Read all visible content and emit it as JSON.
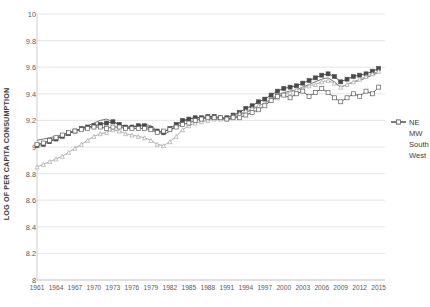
{
  "chart_data": {
    "type": "line",
    "title": "",
    "subtitle": "",
    "xlabel": "",
    "ylabel": "LOG OF PER CAPITA CONSUMPTION",
    "xlim": [
      1961,
      2016
    ],
    "ylim": [
      8,
      10
    ],
    "ytick_step": 0.2,
    "xtick_step": 3,
    "grid": "horizontal",
    "legend_position": "right",
    "ytick_labels": [
      "8",
      "8.2",
      "8.4",
      "8.6",
      "8.8",
      "9",
      "9.2",
      "9.4",
      "9.6",
      "9.8",
      "10"
    ],
    "ytick_values": [
      8,
      8.2,
      8.4,
      8.6,
      8.8,
      9,
      9.2,
      9.4,
      9.6,
      9.8,
      10
    ],
    "xtick_labels": [
      "1961",
      "1964",
      "1967",
      "1970",
      "1973",
      "1976",
      "1979",
      "1982",
      "1985",
      "1988",
      "1991",
      "1994",
      "1997",
      "2000",
      "2003",
      "2006",
      "2009",
      "2012",
      "2015"
    ],
    "xtick_values": [
      1961,
      1964,
      1967,
      1970,
      1973,
      1976,
      1979,
      1982,
      1985,
      1988,
      1991,
      1994,
      1997,
      2000,
      2003,
      2006,
      2009,
      2012,
      2015
    ],
    "x": [
      1961,
      1962,
      1963,
      1964,
      1965,
      1966,
      1967,
      1968,
      1969,
      1970,
      1971,
      1972,
      1973,
      1974,
      1975,
      1976,
      1977,
      1978,
      1979,
      1980,
      1981,
      1982,
      1983,
      1984,
      1985,
      1986,
      1987,
      1988,
      1989,
      1990,
      1991,
      1992,
      1993,
      1994,
      1995,
      1996,
      1997,
      1998,
      1999,
      2000,
      2001,
      2002,
      2003,
      2004,
      2005,
      2006,
      2007,
      2008,
      2009,
      2010,
      2011,
      2012,
      2013,
      2014,
      2015
    ],
    "series": [
      {
        "name": "NE",
        "color": "#6e6e6e",
        "marker": "none",
        "values": [
          9.05,
          9.06,
          9.07,
          9.08,
          9.09,
          9.11,
          9.12,
          9.14,
          9.16,
          9.18,
          9.2,
          9.21,
          9.19,
          9.17,
          9.15,
          9.15,
          9.16,
          9.17,
          9.16,
          9.12,
          9.09,
          9.12,
          9.16,
          9.19,
          9.21,
          9.22,
          9.22,
          9.22,
          9.21,
          9.21,
          9.2,
          9.22,
          9.24,
          9.26,
          9.28,
          9.31,
          9.33,
          9.36,
          9.39,
          9.41,
          9.42,
          9.43,
          9.45,
          9.47,
          9.49,
          9.51,
          9.52,
          9.49,
          9.45,
          9.47,
          9.49,
          9.5,
          9.52,
          9.54,
          9.56
        ]
      },
      {
        "name": "MW",
        "color": "#4a4a4a",
        "marker": "square",
        "values": [
          9.01,
          9.02,
          9.04,
          9.06,
          9.08,
          9.1,
          9.12,
          9.14,
          9.15,
          9.16,
          9.17,
          9.18,
          9.19,
          9.17,
          9.15,
          9.15,
          9.16,
          9.16,
          9.14,
          9.12,
          9.11,
          9.14,
          9.17,
          9.2,
          9.21,
          9.22,
          9.22,
          9.23,
          9.23,
          9.22,
          9.22,
          9.24,
          9.26,
          9.29,
          9.31,
          9.34,
          9.36,
          9.39,
          9.42,
          9.44,
          9.45,
          9.46,
          9.48,
          9.5,
          9.52,
          9.54,
          9.55,
          9.53,
          9.49,
          9.51,
          9.53,
          9.54,
          9.55,
          9.57,
          9.59
        ]
      },
      {
        "name": "South",
        "color": "#a8a8a8",
        "marker": "triangle",
        "values": [
          8.85,
          8.87,
          8.89,
          8.91,
          8.93,
          8.96,
          8.99,
          9.02,
          9.05,
          9.08,
          9.1,
          9.11,
          9.13,
          9.12,
          9.1,
          9.09,
          9.08,
          9.07,
          9.05,
          9.02,
          9.01,
          9.04,
          9.08,
          9.13,
          9.16,
          9.18,
          9.19,
          9.2,
          9.21,
          9.21,
          9.21,
          9.23,
          9.25,
          9.27,
          9.29,
          9.31,
          9.33,
          9.35,
          9.37,
          9.4,
          9.41,
          9.43,
          9.44,
          9.46,
          9.47,
          9.49,
          9.5,
          9.48,
          9.45,
          9.47,
          9.49,
          9.51,
          9.53,
          9.55,
          9.57
        ]
      },
      {
        "name": "West",
        "color": "#5f5f5f",
        "marker": "square-open",
        "values": [
          9.02,
          9.03,
          9.05,
          9.07,
          9.09,
          9.11,
          9.12,
          9.13,
          9.14,
          9.15,
          9.15,
          9.14,
          9.15,
          9.15,
          9.14,
          9.14,
          9.14,
          9.14,
          9.13,
          9.11,
          9.12,
          9.13,
          9.15,
          9.17,
          9.18,
          9.2,
          9.21,
          9.22,
          9.22,
          9.22,
          9.21,
          9.22,
          9.22,
          9.24,
          9.26,
          9.28,
          9.31,
          9.35,
          9.38,
          9.39,
          9.37,
          9.4,
          9.42,
          9.38,
          9.41,
          9.44,
          9.41,
          9.37,
          9.34,
          9.37,
          9.4,
          9.38,
          9.42,
          9.4,
          9.45
        ]
      }
    ],
    "legend": [
      {
        "label": "NE"
      },
      {
        "label": "MW"
      },
      {
        "label": "South"
      },
      {
        "label": "West"
      }
    ]
  },
  "colors": {
    "grid": "#dedede",
    "axis": "#c8c8c8",
    "text": "#5a5a5a",
    "title_text": "#3a3a3a"
  }
}
